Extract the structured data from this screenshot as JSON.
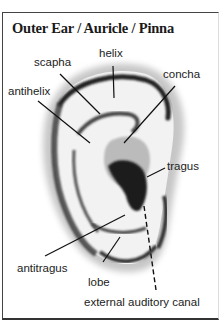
{
  "title": "Outer Ear / Auricle / Pinna",
  "labels": {
    "helix": "helix",
    "scapha": "scapha",
    "antihelix": "antihelix",
    "concha": "concha",
    "tragus": "tragus",
    "antitragus": "antitragus",
    "lobe": "lobe",
    "external_auditory_canal": "external auditory canal"
  }
}
